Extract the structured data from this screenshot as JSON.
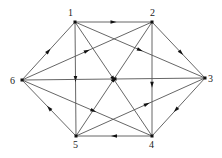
{
  "diagram": {
    "type": "directed-graph",
    "colors": {
      "edge": "#555555",
      "node": "#111111",
      "label": "#222222"
    },
    "nodes": [
      {
        "id": "1",
        "label": "1"
      },
      {
        "id": "2",
        "label": "2"
      },
      {
        "id": "3",
        "label": "3"
      },
      {
        "id": "4",
        "label": "4"
      },
      {
        "id": "5",
        "label": "5"
      },
      {
        "id": "6",
        "label": "6"
      }
    ],
    "edges": [
      {
        "from": "1",
        "to": "2"
      },
      {
        "from": "6",
        "to": "1"
      },
      {
        "from": "6",
        "to": "2"
      },
      {
        "from": "1",
        "to": "3"
      },
      {
        "from": "2",
        "to": "3"
      },
      {
        "from": "1",
        "to": "5"
      },
      {
        "from": "1",
        "to": "4"
      },
      {
        "from": "2",
        "to": "4"
      },
      {
        "from": "5",
        "to": "2"
      },
      {
        "from": "3",
        "to": "6"
      },
      {
        "from": "3",
        "to": "4"
      },
      {
        "from": "5",
        "to": "3"
      },
      {
        "from": "6",
        "to": "4"
      },
      {
        "from": "5",
        "to": "6"
      },
      {
        "from": "4",
        "to": "5"
      }
    ]
  }
}
